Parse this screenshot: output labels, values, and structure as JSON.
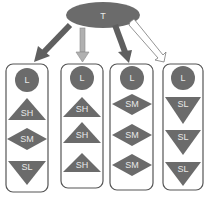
{
  "root": {
    "label": "T",
    "color": "#6b6b6b"
  },
  "arrows": [
    {
      "style": "dark-filled",
      "color": "#5f5f5f"
    },
    {
      "style": "light-filled",
      "color": "#b0b0b0"
    },
    {
      "style": "dark-filled",
      "color": "#5f5f5f"
    },
    {
      "style": "outline",
      "color": "#ffffff"
    }
  ],
  "columns": [
    {
      "top": "L",
      "items": [
        {
          "shape": "triangle-up",
          "label": "SH"
        },
        {
          "shape": "diamond",
          "label": "SM"
        },
        {
          "shape": "triangle-down",
          "label": "SL"
        }
      ]
    },
    {
      "top": "L",
      "items": [
        {
          "shape": "triangle-up",
          "label": "SH"
        },
        {
          "shape": "triangle-up",
          "label": "SH"
        },
        {
          "shape": "triangle-up",
          "label": "SH"
        }
      ]
    },
    {
      "top": "L",
      "items": [
        {
          "shape": "diamond",
          "label": "SM"
        },
        {
          "shape": "diamond",
          "label": "SM"
        },
        {
          "shape": "diamond",
          "label": "SM"
        }
      ]
    },
    {
      "top": "L",
      "items": [
        {
          "shape": "triangle-down",
          "label": "SL"
        },
        {
          "shape": "triangle-down",
          "label": "SL"
        },
        {
          "shape": "triangle-down",
          "label": "SL"
        }
      ]
    }
  ],
  "colors": {
    "shape_fill": "#6b6b6b",
    "box_stroke": "#555555",
    "text": "#e8e8e8"
  }
}
